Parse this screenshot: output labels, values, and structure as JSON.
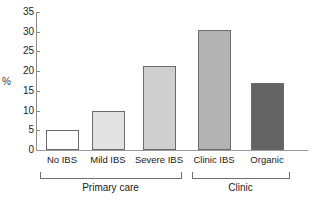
{
  "chart_data": {
    "type": "bar",
    "title": "",
    "xlabel": "",
    "ylabel": "%",
    "ylim": [
      0,
      35
    ],
    "yticks": [
      0,
      5,
      10,
      15,
      20,
      25,
      30,
      35
    ],
    "ytick_labels": [
      "0",
      "5",
      "10",
      "15",
      "20",
      "25",
      "30",
      "35"
    ],
    "grid": false,
    "legend": "none",
    "categories": [
      "No IBS",
      "Mild IBS",
      "Severe IBS",
      "Clinic IBS",
      "Organic"
    ],
    "values": [
      5.0,
      9.8,
      21.3,
      30.5,
      17.0
    ],
    "bar_colors": [
      "#ffffff",
      "#e2e2e2",
      "#cfcfcf",
      "#b3b3b3",
      "#636363"
    ],
    "bar_edge_color": "#6b6b6b",
    "groups": [
      {
        "label": "Primary care",
        "categories": [
          "No IBS",
          "Mild IBS",
          "Severe IBS"
        ]
      },
      {
        "label": "Clinic",
        "categories": [
          "Clinic IBS",
          "Organic"
        ]
      }
    ]
  },
  "axes": {
    "y_label": "%",
    "y_ticks": [
      "35",
      "30",
      "25",
      "20",
      "15",
      "10",
      "5",
      "0"
    ]
  },
  "categories": [
    {
      "label": "No IBS"
    },
    {
      "label": "Mild IBS"
    },
    {
      "label": "Severe IBS"
    },
    {
      "label": "Clinic IBS"
    },
    {
      "label": "Organic"
    }
  ],
  "groups": [
    {
      "label": "Primary care"
    },
    {
      "label": "Clinic"
    }
  ]
}
